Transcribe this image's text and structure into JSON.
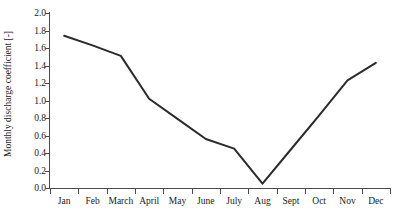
{
  "chart_data": {
    "type": "line",
    "title": "",
    "xlabel": "",
    "ylabel": "Monthly discharge coefficient [-]",
    "categories": [
      "Jan",
      "Feb",
      "March",
      "April",
      "May",
      "June",
      "July",
      "Aug",
      "Sept",
      "Oct",
      "Nov",
      "Dec"
    ],
    "values": [
      1.74,
      1.63,
      1.51,
      1.02,
      0.79,
      0.56,
      0.45,
      0.05,
      0.44,
      0.83,
      1.23,
      1.43
    ],
    "series": [
      {
        "name": "Monthly discharge coefficient",
        "values": [
          1.74,
          1.63,
          1.51,
          1.02,
          0.79,
          0.56,
          0.45,
          0.05,
          0.44,
          0.83,
          1.23,
          1.43
        ]
      }
    ],
    "ylim": [
      0.0,
      2.0
    ],
    "ytick_labels": [
      "0.0",
      "0.2",
      "0.4",
      "0.6",
      "0.8",
      "1.0",
      "1.2",
      "1.4",
      "1.6",
      "1.8",
      "2.0"
    ],
    "ytick_values": [
      0.0,
      0.2,
      0.4,
      0.6,
      0.8,
      1.0,
      1.2,
      1.4,
      1.6,
      1.8,
      2.0
    ],
    "grid": false,
    "legend": "none",
    "line_color": "#2b2b2b",
    "axis_color": "#4a4a4a",
    "text_color": "#1a1a1a"
  }
}
